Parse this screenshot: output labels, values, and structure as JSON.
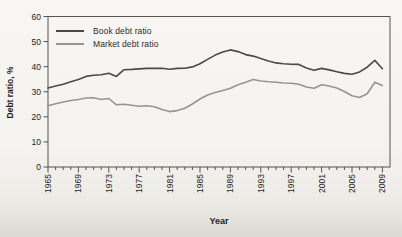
{
  "figure": {
    "background": "#f4f3ef",
    "frame_color": "#55534f",
    "text_color": "#232220"
  },
  "chart_data": {
    "type": "line",
    "title": "",
    "xlabel": "Year",
    "ylabel": "Debt ratio, %",
    "x_range": [
      1965,
      2010
    ],
    "ylim": [
      0,
      60
    ],
    "y_ticks": [
      0,
      10,
      20,
      30,
      40,
      50,
      60
    ],
    "x_major_ticks": [
      1965,
      1969,
      1973,
      1977,
      1981,
      1985,
      1989,
      1993,
      1997,
      2001,
      2005,
      2009
    ],
    "x_minor_tick_interval": 1,
    "grid": false,
    "legend_position": "top-left-inside",
    "x": [
      1965,
      1966,
      1967,
      1968,
      1969,
      1970,
      1971,
      1972,
      1973,
      1974,
      1975,
      1976,
      1977,
      1978,
      1979,
      1980,
      1981,
      1982,
      1983,
      1984,
      1985,
      1986,
      1987,
      1988,
      1989,
      1990,
      1991,
      1992,
      1993,
      1994,
      1995,
      1996,
      1997,
      1998,
      1999,
      2000,
      2001,
      2002,
      2003,
      2004,
      2005,
      2006,
      2007,
      2008,
      2009
    ],
    "series": [
      {
        "name": "Book debt ratio",
        "color": "#4b4a48",
        "values": [
          31.5,
          32.3,
          33.0,
          34.0,
          34.9,
          36.1,
          36.6,
          36.8,
          37.4,
          36.1,
          38.8,
          38.9,
          39.1,
          39.3,
          39.3,
          39.4,
          39.0,
          39.3,
          39.4,
          39.9,
          41.2,
          42.9,
          44.6,
          45.8,
          46.7,
          46.0,
          44.8,
          44.2,
          43.2,
          42.3,
          41.5,
          41.2,
          41.0,
          40.9,
          39.5,
          38.6,
          39.3,
          38.7,
          38.0,
          37.3,
          37.0,
          37.9,
          39.8,
          42.5,
          39.2
        ]
      },
      {
        "name": "Market debt ratio",
        "color": "#989591",
        "values": [
          24.4,
          25.2,
          25.9,
          26.5,
          26.9,
          27.5,
          27.6,
          26.9,
          27.3,
          24.8,
          25.0,
          24.6,
          24.2,
          24.4,
          24.0,
          22.9,
          22.1,
          22.5,
          23.4,
          25.1,
          27.1,
          28.7,
          29.7,
          30.5,
          31.4,
          32.8,
          33.8,
          34.9,
          34.3,
          34.0,
          33.8,
          33.5,
          33.4,
          33.0,
          31.9,
          31.4,
          32.8,
          32.3,
          31.5,
          30.1,
          28.4,
          27.7,
          29.2,
          33.8,
          32.5
        ]
      }
    ]
  }
}
